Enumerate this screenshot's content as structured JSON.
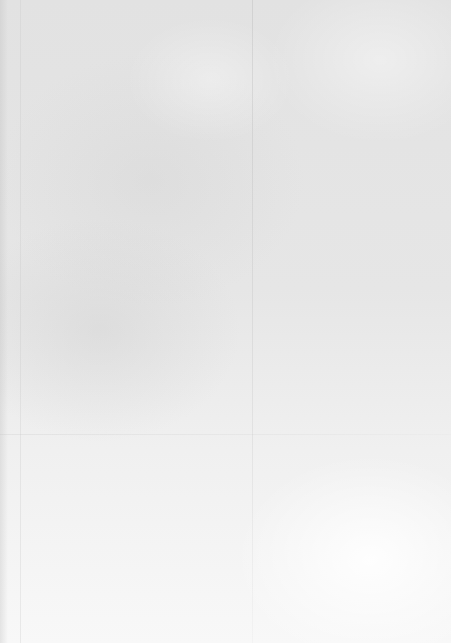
{
  "document": {
    "type": "blank-paper-scan",
    "text_content": ""
  }
}
